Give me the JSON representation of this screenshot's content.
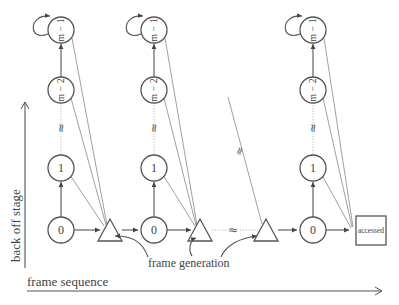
{
  "diagram": {
    "axes": {
      "y_label": "back off stage",
      "x_label": "frame sequence"
    },
    "columns": [
      {
        "nodes": [
          {
            "label": "m − 1",
            "stage": "top"
          },
          {
            "label": "m − 2",
            "stage": "upper"
          },
          {
            "label": "≈",
            "stage": "ellipsis"
          },
          {
            "label": "1",
            "stage": "1"
          },
          {
            "label": "0",
            "stage": "0"
          }
        ]
      },
      {
        "nodes": [
          {
            "label": "m − 1",
            "stage": "top"
          },
          {
            "label": "m − 2",
            "stage": "upper"
          },
          {
            "label": "≈",
            "stage": "ellipsis"
          },
          {
            "label": "1",
            "stage": "1"
          },
          {
            "label": "0",
            "stage": "0"
          }
        ]
      },
      {
        "nodes": [
          {
            "label": "m − 1",
            "stage": "top"
          },
          {
            "label": "m − 2",
            "stage": "upper"
          },
          {
            "label": "≈",
            "stage": "ellipsis"
          },
          {
            "label": "1",
            "stage": "1"
          },
          {
            "label": "0",
            "stage": "0"
          }
        ]
      }
    ],
    "frame_generation_label": "frame generation",
    "terminal_label": "accessed",
    "gap_symbol": "≈",
    "colors": {
      "stroke": "#555555",
      "text": "#444444",
      "dotted": "#bbbbbb"
    }
  }
}
